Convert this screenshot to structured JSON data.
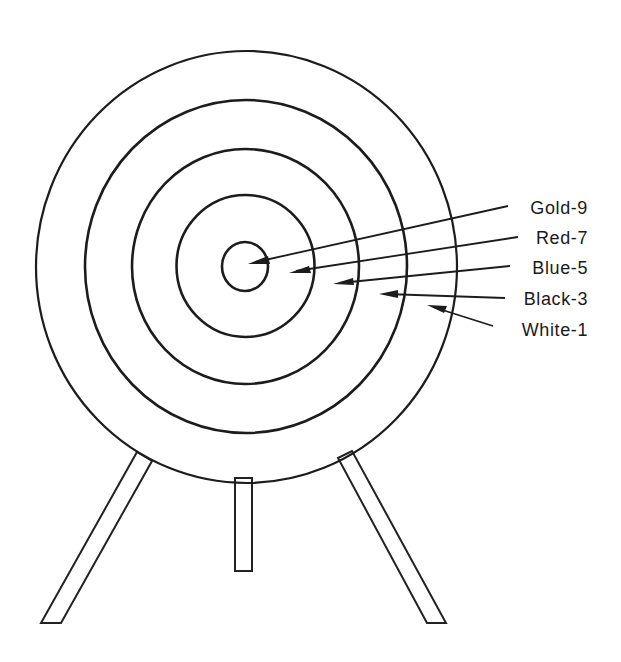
{
  "colors": {
    "ink": "#1c1c1c",
    "background": "#ffffff",
    "black_ring_shade": "#7a7a7a",
    "blue_ring_shade": "#e2e2e2",
    "red_ring_shade": "#9a9a9a",
    "gold_ring_shade": "#f6f6f6",
    "white_ring_shade": "#ffffff"
  },
  "rings": [
    {
      "name": "White",
      "score": 1,
      "label": "White-1",
      "shade": "white"
    },
    {
      "name": "Black",
      "score": 3,
      "label": "Black-3",
      "shade": "dark-dots"
    },
    {
      "name": "Blue",
      "score": 5,
      "label": "Blue-5",
      "shade": "light-dots"
    },
    {
      "name": "Red",
      "score": 7,
      "label": "Red-7",
      "shade": "medium-dots"
    },
    {
      "name": "Gold",
      "score": 9,
      "label": "Gold-9",
      "shade": "white"
    }
  ],
  "callouts": [
    {
      "ring": "Gold",
      "text": "Gold-9"
    },
    {
      "ring": "Red",
      "text": "Red-7"
    },
    {
      "ring": "Blue",
      "text": "Blue-5"
    },
    {
      "ring": "Black",
      "text": "Black-3"
    },
    {
      "ring": "White",
      "text": "White-1"
    }
  ],
  "stand": {
    "legs": 3
  }
}
